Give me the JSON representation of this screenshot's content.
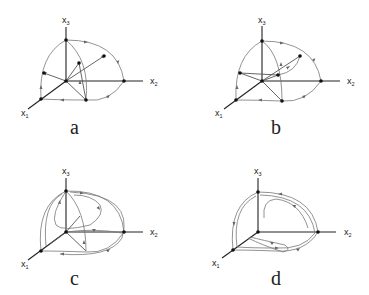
{
  "figure": {
    "axis_labels": {
      "x1": "x",
      "x1_sub": "1",
      "x2": "x",
      "x2_sub": "2",
      "x3": "x",
      "x3_sub": "3"
    },
    "panels": [
      {
        "id": "a",
        "label": "a"
      },
      {
        "id": "b",
        "label": "b"
      },
      {
        "id": "c",
        "label": "c"
      },
      {
        "id": "d",
        "label": "d"
      }
    ]
  }
}
